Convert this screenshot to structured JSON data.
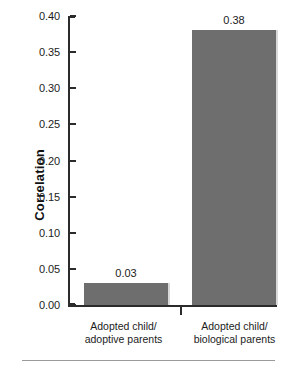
{
  "chart_data": {
    "type": "bar",
    "title": "",
    "xlabel": "",
    "ylabel": "Correlation",
    "categories": [
      "Adopted child/\nadoptive parents",
      "Adopted child/\nbiological parents"
    ],
    "category_lines": [
      [
        "Adopted child/",
        "adoptive parents"
      ],
      [
        "Adopted child/",
        "biological parents"
      ]
    ],
    "values": [
      0.03,
      0.38
    ],
    "value_labels": [
      "0.03",
      "0.38"
    ],
    "ylim": [
      0.0,
      0.4
    ],
    "ytick_values": [
      0.4,
      0.35,
      0.3,
      0.25,
      0.2,
      0.15,
      0.1,
      0.05,
      0.0
    ],
    "ytick_labels": [
      "0.40",
      "0.35",
      "0.30",
      "0.25",
      "0.20",
      "0.15",
      "0.10",
      "0.05",
      "0.00"
    ],
    "grid": false,
    "legend": false,
    "bar_color": "#6e6e6e",
    "axis_color": "#2b2b2b",
    "background": "#ffffff"
  }
}
